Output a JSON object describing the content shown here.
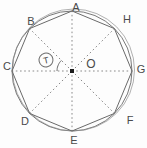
{
  "figure": {
    "width": 147,
    "height": 148,
    "background": "#fdfdfd",
    "stroke_color": "#6a6a6a",
    "sketch_stroke_color": "#8f8f8f",
    "dash_color": "#8a8a8a",
    "label_color": "#4a4a4a",
    "center_dot_color": "#1c1c1c",
    "center": {
      "x": 72,
      "y": 71,
      "dot_size": 4,
      "label": "O",
      "label_x": 91,
      "label_y": 64
    },
    "circle": {
      "radius": 60,
      "sketch_dx": 1.5,
      "sketch_dy": -1,
      "sketch_dr": 1
    },
    "vertices": [
      {
        "label": "A",
        "angle_deg": 90,
        "label_x": 76,
        "label_y": 7
      },
      {
        "label": "B",
        "angle_deg": 135,
        "label_x": 31,
        "label_y": 21
      },
      {
        "label": "C",
        "angle_deg": 180,
        "label_x": 7,
        "label_y": 66
      },
      {
        "label": "D",
        "angle_deg": 225,
        "label_x": 25,
        "label_y": 121
      },
      {
        "label": "E",
        "angle_deg": 270,
        "label_x": 74,
        "label_y": 140
      },
      {
        "label": "F",
        "angle_deg": 315,
        "label_x": 130,
        "label_y": 120
      },
      {
        "label": "G",
        "angle_deg": 0,
        "label_x": 141,
        "label_y": 69
      },
      {
        "label": "H",
        "angle_deg": 45,
        "label_x": 127,
        "label_y": 19
      }
    ],
    "angle_marker": {
      "from_deg": 135,
      "to_deg": 180,
      "arc_radius": 15,
      "badge": {
        "label": "T",
        "x": 46,
        "y": 60,
        "radius": 7,
        "tilt_deg": -12
      }
    }
  }
}
